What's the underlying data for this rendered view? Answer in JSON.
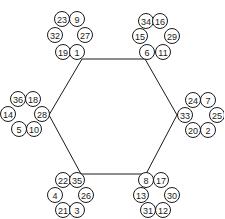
{
  "diagram": {
    "type": "hexagon-with-number-clusters",
    "hexagon": {
      "vertices": [
        {
          "id": "top-left",
          "x": 82,
          "y": 59
        },
        {
          "id": "top-right",
          "x": 145,
          "y": 59
        },
        {
          "id": "right",
          "x": 177,
          "y": 115
        },
        {
          "id": "bottom-right",
          "x": 146,
          "y": 174
        },
        {
          "id": "bottom-left",
          "x": 81,
          "y": 174
        },
        {
          "id": "left",
          "x": 49,
          "y": 115
        }
      ]
    },
    "clusters": [
      {
        "id": "top-left",
        "nodes": [
          {
            "label": "23",
            "x": 62,
            "y": 19
          },
          {
            "label": "9",
            "x": 77,
            "y": 19
          },
          {
            "label": "32",
            "x": 55,
            "y": 35
          },
          {
            "label": "27",
            "x": 85,
            "y": 35
          },
          {
            "label": "19",
            "x": 63,
            "y": 52
          },
          {
            "label": "1",
            "x": 77,
            "y": 52
          }
        ]
      },
      {
        "id": "top-right",
        "nodes": [
          {
            "label": "34",
            "x": 146,
            "y": 21
          },
          {
            "label": "16",
            "x": 160,
            "y": 21
          },
          {
            "label": "15",
            "x": 140,
            "y": 36
          },
          {
            "label": "29",
            "x": 172,
            "y": 36
          },
          {
            "label": "6",
            "x": 147,
            "y": 52
          },
          {
            "label": "11",
            "x": 163,
            "y": 52
          }
        ]
      },
      {
        "id": "left",
        "nodes": [
          {
            "label": "36",
            "x": 18,
            "y": 99
          },
          {
            "label": "18",
            "x": 33,
            "y": 99
          },
          {
            "label": "14",
            "x": 8,
            "y": 114
          },
          {
            "label": "28",
            "x": 42,
            "y": 114
          },
          {
            "label": "5",
            "x": 19,
            "y": 129
          },
          {
            "label": "10",
            "x": 34,
            "y": 129
          }
        ]
      },
      {
        "id": "right",
        "nodes": [
          {
            "label": "24",
            "x": 193,
            "y": 100
          },
          {
            "label": "7",
            "x": 208,
            "y": 100
          },
          {
            "label": "33",
            "x": 185,
            "y": 115
          },
          {
            "label": "25",
            "x": 217,
            "y": 115
          },
          {
            "label": "20",
            "x": 193,
            "y": 130
          },
          {
            "label": "2",
            "x": 208,
            "y": 130
          }
        ]
      },
      {
        "id": "bottom-left",
        "nodes": [
          {
            "label": "22",
            "x": 63,
            "y": 180
          },
          {
            "label": "35",
            "x": 77,
            "y": 180
          },
          {
            "label": "4",
            "x": 55,
            "y": 195
          },
          {
            "label": "26",
            "x": 86,
            "y": 195
          },
          {
            "label": "21",
            "x": 63,
            "y": 210
          },
          {
            "label": "3",
            "x": 77,
            "y": 210
          }
        ]
      },
      {
        "id": "bottom-right",
        "nodes": [
          {
            "label": "8",
            "x": 146,
            "y": 180
          },
          {
            "label": "17",
            "x": 161,
            "y": 180
          },
          {
            "label": "13",
            "x": 141,
            "y": 195
          },
          {
            "label": "30",
            "x": 172,
            "y": 195
          },
          {
            "label": "31",
            "x": 148,
            "y": 210
          },
          {
            "label": "12",
            "x": 163,
            "y": 210
          }
        ]
      }
    ],
    "node_radius": 7.5,
    "stroke_color": "#1a1a1a",
    "background": "#ffffff"
  }
}
